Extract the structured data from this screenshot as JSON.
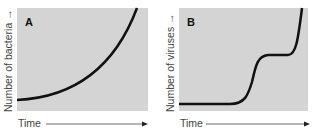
{
  "panels": [
    {
      "label": "A",
      "ylabel": "Number of bacteria",
      "xlabel": "Time",
      "curve": "exponential"
    },
    {
      "label": "B",
      "ylabel": "Number of viruses",
      "xlabel": "Time",
      "curve": "stepwise"
    }
  ],
  "colors": {
    "panel_bg": "#d4d4d4",
    "curve": "#111111",
    "text": "#444444"
  }
}
